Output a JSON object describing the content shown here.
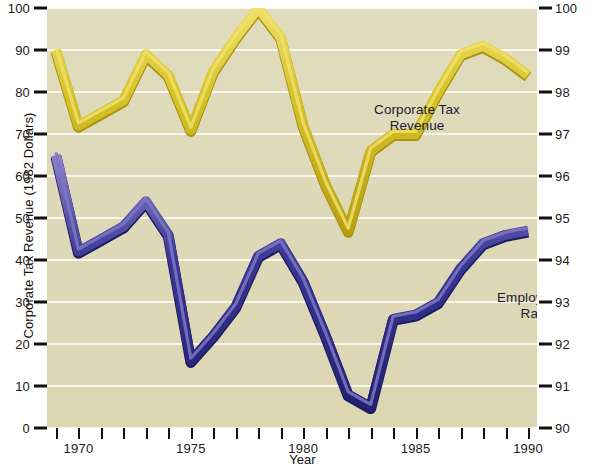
{
  "chart_data": {
    "type": "line",
    "title": "",
    "xlabel": "Year",
    "ylabel": "Corporate Tax Revenue (1982 Dollars)",
    "ylabel_right": "Employment Rate (%)",
    "grid": true,
    "legend_position": "inline-annotation",
    "x": [
      1969,
      1970,
      1971,
      1972,
      1973,
      1974,
      1975,
      1976,
      1977,
      1978,
      1979,
      1980,
      1981,
      1982,
      1983,
      1984,
      1985,
      1986,
      1987,
      1988,
      1989,
      1990
    ],
    "xlim": [
      1968.6,
      1990.4
    ],
    "xticks_major": [
      1970,
      1975,
      1980,
      1985,
      1990
    ],
    "xtick_labels": [
      "1970",
      "1975",
      "1980",
      "1985",
      "1990"
    ],
    "xticks_all": [
      1969,
      1970,
      1971,
      1972,
      1973,
      1974,
      1975,
      1976,
      1977,
      1978,
      1979,
      1980,
      1981,
      1982,
      1983,
      1984,
      1985,
      1986,
      1987,
      1988,
      1989,
      1990
    ],
    "ylim_left": [
      0,
      100
    ],
    "yticks_left": [
      0,
      10,
      20,
      30,
      40,
      50,
      60,
      70,
      80,
      90,
      100
    ],
    "ytick_labels_left": [
      "0",
      "10",
      "20",
      "30",
      "40",
      "50",
      "60",
      "70",
      "80",
      "90",
      "100"
    ],
    "ylim_right": [
      90,
      100
    ],
    "yticks_right": [
      90,
      91,
      92,
      93,
      94,
      95,
      96,
      97,
      98,
      99,
      100
    ],
    "ytick_labels_right": [
      "90",
      "91",
      "92",
      "93",
      "94",
      "95",
      "96",
      "97",
      "98",
      "99",
      "100"
    ],
    "series": [
      {
        "name": "Corporate Tax Revenue",
        "axis": "left",
        "color": "#d4bb1f",
        "highlight_color": "#efe06a",
        "shadow_color": "#a8930f",
        "annotation": "Corporate Tax\nRevenue",
        "values": [
          90,
          72,
          75,
          78,
          89,
          84,
          71,
          85,
          93,
          100,
          93,
          72,
          58,
          47,
          66,
          70,
          70,
          80,
          89,
          91,
          88,
          84
        ]
      },
      {
        "name": "Employment Rate",
        "axis": "right",
        "color": "#2b2a8c",
        "highlight_color": "#7e77c4",
        "shadow_color": "#1a1a5e",
        "annotation": "Employment\nRate",
        "values_left_scale": [
          65,
          42,
          45,
          48,
          54,
          46,
          16,
          22,
          29,
          41,
          44,
          35,
          22,
          8,
          5,
          26,
          27,
          30,
          38,
          44,
          46,
          47
        ],
        "values": [
          96.5,
          94.2,
          94.5,
          94.8,
          95.4,
          94.6,
          91.6,
          92.2,
          92.9,
          94.1,
          94.4,
          93.5,
          92.2,
          90.8,
          90.5,
          92.6,
          92.7,
          93.0,
          93.8,
          94.4,
          94.6,
          94.7
        ]
      }
    ]
  },
  "axes": {
    "left_title": "Corporate Tax Revenue (1982 Dollars)",
    "right_title": "Employment Rate (%)",
    "bottom_title": "Year"
  },
  "annotations": {
    "tax_line1": "Corporate Tax",
    "tax_line2": "Revenue",
    "emp_line1": "Employment",
    "emp_line2": "Rate"
  },
  "colors": {
    "plot_background": "#ded9b8",
    "page_background": "#ffffff",
    "gridline": "#fbf8ee",
    "tax_revenue": "#d4bb1f",
    "employment_rate": "#2b2a8c",
    "text": "#111111"
  }
}
